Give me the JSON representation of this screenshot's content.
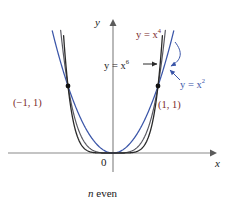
{
  "figure": {
    "caption_prefix": "n",
    "caption_suffix": " even",
    "background": "#ffffff"
  },
  "axes": {
    "y_label": "y",
    "x_label": "x",
    "origin_label": "0",
    "axis_color": "#8a8a8a"
  },
  "labels": {
    "x4": {
      "lhs": "y = x",
      "exp": "4",
      "color": "#7a2b2b"
    },
    "x6": {
      "lhs": "y = x",
      "exp": "6",
      "color": "#1a1a1a"
    },
    "x2": {
      "lhs": "y = x",
      "exp": "2",
      "color": "#3a55a8"
    },
    "point_left": "(−1, 1)",
    "point_right": "(1, 1)"
  },
  "chart_data": {
    "type": "line",
    "title": "",
    "subtitle": "n even",
    "xlabel": "x",
    "ylabel": "y",
    "xlim": [
      -1.45,
      1.45
    ],
    "ylim": [
      -0.12,
      1.95
    ],
    "grid": false,
    "legend": "inline-annotations",
    "series": [
      {
        "name": "y = x^2",
        "equation": "y = x^2",
        "exponent": 2,
        "color": "#3a55a8",
        "x": [
          -1.45,
          -1.3,
          -1.15,
          -1.0,
          -0.85,
          -0.7,
          -0.55,
          -0.4,
          -0.25,
          -0.1,
          0,
          0.1,
          0.25,
          0.4,
          0.55,
          0.7,
          0.85,
          1.0,
          1.15,
          1.3,
          1.45
        ],
        "y": [
          2.1025,
          1.69,
          1.3225,
          1.0,
          0.7225,
          0.49,
          0.3025,
          0.16,
          0.0625,
          0.01,
          0,
          0.01,
          0.0625,
          0.16,
          0.3025,
          0.49,
          0.7225,
          1.0,
          1.3225,
          1.69,
          2.1025
        ]
      },
      {
        "name": "y = x^4",
        "equation": "y = x^4",
        "exponent": 4,
        "color": "#5a5a62",
        "x": [
          -1.2,
          -1.1,
          -1.0,
          -0.9,
          -0.8,
          -0.7,
          -0.6,
          -0.5,
          -0.4,
          -0.3,
          -0.2,
          -0.1,
          0,
          0.1,
          0.2,
          0.3,
          0.4,
          0.5,
          0.6,
          0.7,
          0.8,
          0.9,
          1.0,
          1.1,
          1.2
        ],
        "y": [
          2.0736,
          1.4641,
          1.0,
          0.6561,
          0.4096,
          0.2401,
          0.1296,
          0.0625,
          0.0256,
          0.0081,
          0.0016,
          0.0001,
          0,
          0.0001,
          0.0016,
          0.0081,
          0.0256,
          0.0625,
          0.1296,
          0.2401,
          0.4096,
          0.6561,
          1.0,
          1.4641,
          2.0736
        ]
      },
      {
        "name": "y = x^6",
        "equation": "y = x^6",
        "exponent": 6,
        "color": "#2a2a2a",
        "x": [
          -1.13,
          -1.08,
          -1.04,
          -1.0,
          -0.95,
          -0.9,
          -0.8,
          -0.7,
          -0.6,
          -0.5,
          -0.4,
          -0.3,
          -0.2,
          -0.1,
          0,
          0.1,
          0.2,
          0.3,
          0.4,
          0.5,
          0.6,
          0.7,
          0.8,
          0.9,
          0.95,
          1.0,
          1.04,
          1.08,
          1.13
        ],
        "y": [
          2.08,
          1.5869,
          1.2653,
          1.0,
          0.7351,
          0.5314,
          0.2621,
          0.1176,
          0.0467,
          0.0156,
          0.0041,
          0.0007,
          6e-05,
          1e-06,
          0,
          1e-06,
          6e-05,
          0.0007,
          0.0041,
          0.0156,
          0.0467,
          0.1176,
          0.2621,
          0.5314,
          0.7351,
          1.0,
          1.2653,
          1.5869,
          2.08
        ]
      }
    ],
    "marked_points": [
      {
        "label": "(−1, 1)",
        "x": -1,
        "y": 1
      },
      {
        "label": "(1, 1)",
        "x": 1,
        "y": 1
      }
    ],
    "annotations": [
      {
        "text": "y = x^4",
        "target_series": "y = x^4"
      },
      {
        "text": "y = x^6",
        "target_series": "y = x^6"
      },
      {
        "text": "y = x^2",
        "target_series": "y = x^2"
      }
    ]
  }
}
